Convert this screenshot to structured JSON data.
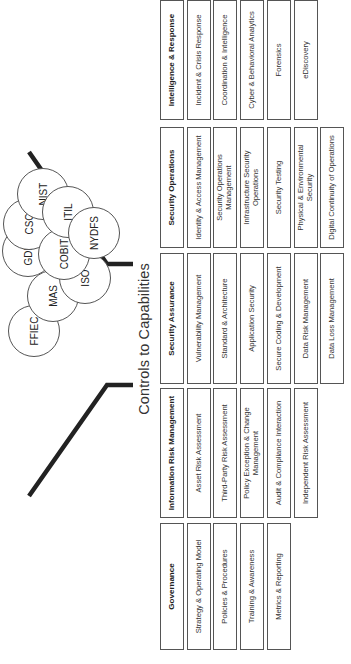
{
  "diagram": {
    "title": "Controls to Capabilities",
    "frameworks": [
      {
        "label": "FFIEC",
        "u": 332,
        "v": 33
      },
      {
        "label": "MAS",
        "u": 367,
        "v": 52
      },
      {
        "label": "GDPR",
        "u": 412,
        "v": 27
      },
      {
        "label": "CSC",
        "u": 439,
        "v": 28
      },
      {
        "label": "NIST",
        "u": 469,
        "v": 42
      },
      {
        "label": "COBIT",
        "u": 409,
        "v": 63
      },
      {
        "label": "ITIL",
        "u": 451,
        "v": 67
      },
      {
        "label": "ISO",
        "u": 385,
        "v": 84
      },
      {
        "label": "NYDFS",
        "u": 430,
        "v": 93
      }
    ],
    "columns": [
      {
        "heading": "Governance",
        "items": [
          "Strategy & Operating Model",
          "Policies & Procedures",
          "Training & Awareness",
          "Metrics & Reporting"
        ]
      },
      {
        "heading": "Information Risk Management",
        "items": [
          "Asset Risk Assessment",
          "Third-Party Risk Assessment",
          "Policy Exception & Change Management",
          "Audit & Compliance Interaction",
          "Independent Risk Assessment"
        ]
      },
      {
        "heading": "Security Assurance",
        "items": [
          "Vulnerability Management",
          "Standard & Architecture",
          "Application Security",
          "Secure Coding & Development",
          "Data Risk Management",
          "Data Loss Management"
        ]
      },
      {
        "heading": "Security Operations",
        "items": [
          "Identity & Access Management",
          "Security Operations Management",
          "Infrastructure Security Operations",
          "Security Testing",
          "Physical & Environmental Security",
          "Digital Continuity of Operations"
        ]
      },
      {
        "heading": "Intelligence & Response",
        "items": [
          "Incident & Crisis Response",
          "Coordination & Intelligence",
          "Cyber & Behavioral Analytics",
          "Forensics",
          "eDiscovery"
        ]
      }
    ],
    "colors": {
      "line": "#222222",
      "box_border": "#555555",
      "text": "#333333",
      "background": "#ffffff"
    }
  }
}
